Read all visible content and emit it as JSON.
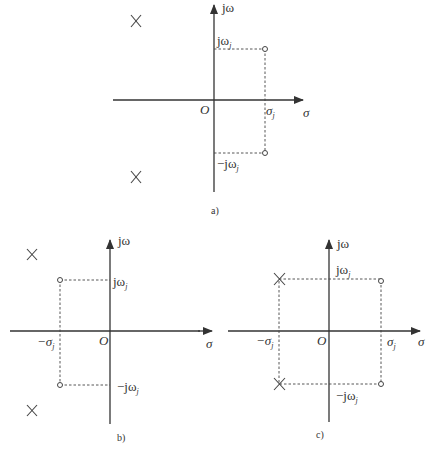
{
  "diagrams": [
    {
      "id": "a",
      "caption": "a)",
      "axes": {
        "vertical_label": "jω",
        "horizontal_label": "σ",
        "origin_label": "O"
      },
      "labels": {
        "pos_freq": "jω",
        "pos_freq_sub": "j",
        "neg_freq": "−jω",
        "neg_freq_sub": "j",
        "sigma": "σ",
        "sigma_sub": "j"
      },
      "poles": [
        {
          "x": -1.7,
          "y": 1.6
        },
        {
          "x": -1.7,
          "y": -1.5
        }
      ],
      "zeros": [
        {
          "x": "σj",
          "y": "jωj"
        },
        {
          "x": "σj",
          "y": "−jωj"
        }
      ]
    },
    {
      "id": "b",
      "caption": "b)",
      "axes": {
        "vertical_label": "jω",
        "horizontal_label": "σ",
        "origin_label": "O"
      },
      "labels": {
        "pos_freq": "jω",
        "pos_freq_sub": "j",
        "neg_freq": "−jω",
        "neg_freq_sub": "j",
        "sigma": "−σ",
        "sigma_sub": "j"
      },
      "poles": [
        {
          "x": -1.5,
          "y": 1.5
        },
        {
          "x": -1.5,
          "y": -1.5
        }
      ],
      "zeros": [
        {
          "x": "−σj",
          "y": "jωj"
        },
        {
          "x": "−σj",
          "y": "−jωj"
        }
      ]
    },
    {
      "id": "c",
      "caption": "c)",
      "axes": {
        "vertical_label": "jω",
        "horizontal_label": "σ",
        "origin_label": "O"
      },
      "labels": {
        "pos_freq": "jω",
        "pos_freq_sub": "j",
        "neg_freq": "−jω",
        "neg_freq_sub": "j",
        "sigma_pos": "σ",
        "sigma_pos_sub": "j",
        "sigma_neg": "−σ",
        "sigma_neg_sub": "j"
      },
      "poles": [
        {
          "x": "−σj",
          "y": "jωj"
        },
        {
          "x": "−σj",
          "y": "−jωj"
        }
      ],
      "zeros": [
        {
          "x": "σj",
          "y": "jωj"
        },
        {
          "x": "σj",
          "y": "−jωj"
        }
      ]
    }
  ],
  "colors": {
    "line": "#333333",
    "background": "#ffffff"
  }
}
